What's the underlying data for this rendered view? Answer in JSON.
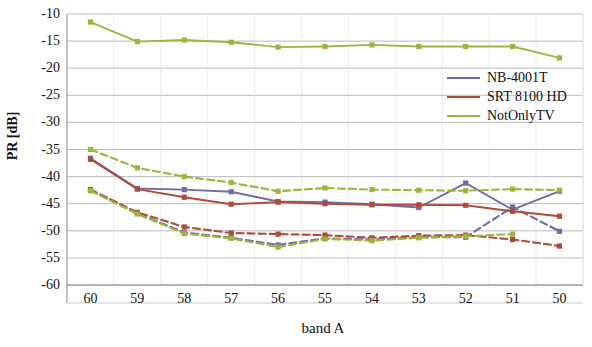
{
  "chart_data": {
    "type": "line",
    "title": "",
    "xlabel": "band A",
    "ylabel": "PR [dB]",
    "categories": [
      "60",
      "59",
      "58",
      "57",
      "56",
      "55",
      "54",
      "53",
      "52",
      "51",
      "50"
    ],
    "ylim": [
      -60,
      -10
    ],
    "ytick_labels": [
      "-10",
      "-15",
      "-20",
      "-25",
      "-30",
      "-35",
      "-40",
      "-45",
      "-50",
      "-55",
      "-60"
    ],
    "ytick_values": [
      -10,
      -15,
      -20,
      -25,
      -30,
      -35,
      -40,
      -45,
      -50,
      -55,
      -60
    ],
    "grid": true,
    "legend_position": "upper-right",
    "series": [
      {
        "name": "NB-4001T",
        "color": "#6E6DA6",
        "style": "solid",
        "values": [
          -36.6,
          -42.2,
          -42.4,
          -42.8,
          -44.6,
          -44.7,
          -45.1,
          -45.7,
          -41.2,
          -46.1,
          -42.7
        ]
      },
      {
        "name": "NB-4001T",
        "color": "#6E6DA6",
        "style": "dashed",
        "values": [
          -42.5,
          -46.8,
          -50.3,
          -51.3,
          -52.6,
          -51.4,
          -51.6,
          -51.2,
          -51.2,
          -45.6,
          -50.1
        ]
      },
      {
        "name": "SRT 8100 HD",
        "color": "#B24A37",
        "style": "solid",
        "values": [
          -36.8,
          -42.3,
          -43.8,
          -45.1,
          -44.7,
          -45.0,
          -45.2,
          -45.2,
          -45.3,
          -46.4,
          -47.3
        ]
      },
      {
        "name": "SRT 8100 HD",
        "color": "#B24A37",
        "style": "dashed",
        "values": [
          -42.4,
          -46.6,
          -49.3,
          -50.4,
          -50.6,
          -50.8,
          -51.3,
          -50.9,
          -50.8,
          -51.6,
          -52.8
        ]
      },
      {
        "name": "NotOnlyTV",
        "color": "#9BB63E",
        "style": "solid",
        "values": [
          -11.5,
          -15.1,
          -14.8,
          -15.2,
          -16.1,
          -16.0,
          -15.7,
          -16.0,
          -16.0,
          -16.0,
          -18.1
        ]
      },
      {
        "name": "NotOnlyTV",
        "color": "#9BB63E",
        "style": "dashed",
        "values": [
          -35.0,
          -38.4,
          -40.0,
          -41.1,
          -42.7,
          -42.1,
          -42.4,
          -42.5,
          -42.6,
          -42.3,
          -42.5
        ]
      },
      {
        "name": "NotOnlyTV",
        "color": "#9BB63E",
        "style": "dashed-low",
        "values": [
          -42.6,
          -46.9,
          -50.5,
          -51.4,
          -53.0,
          -51.5,
          -51.8,
          -51.3,
          -51.0,
          -50.6,
          null
        ]
      }
    ],
    "legend_entries": [
      {
        "label": "NB-4001T",
        "color": "#6E6DA6"
      },
      {
        "label": "SRT 8100 HD",
        "color": "#B24A37"
      },
      {
        "label": "NotOnlyTV",
        "color": "#9BB63E"
      }
    ]
  },
  "plot_geometry": {
    "left": 67,
    "right": 583,
    "top": 14,
    "bottom": 285
  }
}
